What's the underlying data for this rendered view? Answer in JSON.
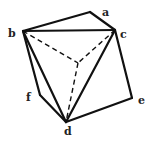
{
  "diagram": {
    "type": "polyhedron-wireframe",
    "stroke_color": "#111111",
    "background": "#ffffff",
    "vertices": {
      "a": {
        "x": 90,
        "y": 12
      },
      "b": {
        "x": 23,
        "y": 31
      },
      "c": {
        "x": 115,
        "y": 30
      },
      "d": {
        "x": 66,
        "y": 122
      },
      "e": {
        "x": 132,
        "y": 98
      },
      "f": {
        "x": 40,
        "y": 95
      },
      "o": {
        "x": 78,
        "y": 63
      }
    },
    "solid_edges": [
      [
        "b",
        "a"
      ],
      [
        "a",
        "c"
      ],
      [
        "b",
        "c"
      ],
      [
        "b",
        "d"
      ],
      [
        "c",
        "d"
      ],
      [
        "c",
        "e"
      ],
      [
        "e",
        "d"
      ],
      [
        "b",
        "f"
      ],
      [
        "f",
        "d"
      ]
    ],
    "dashed_edges": [
      [
        "b",
        "o"
      ],
      [
        "c",
        "o"
      ],
      [
        "o",
        "d"
      ]
    ],
    "labels": [
      {
        "id": "a",
        "text": "a"
      },
      {
        "id": "b",
        "text": "b"
      },
      {
        "id": "c",
        "text": "c"
      },
      {
        "id": "d",
        "text": "d"
      },
      {
        "id": "e",
        "text": "e"
      },
      {
        "id": "f",
        "text": "f"
      }
    ]
  }
}
